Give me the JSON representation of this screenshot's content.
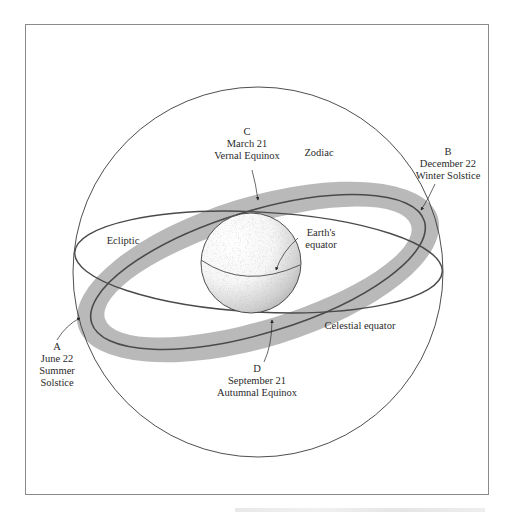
{
  "diagram": {
    "labels": {
      "zodiac": "Zodiac",
      "ecliptic": "Ecliptic",
      "celestial_equator": "Celestial equator",
      "earths_equator_line1": "Earth's",
      "earths_equator_line2": "equator"
    },
    "points": {
      "A": {
        "letter": "A",
        "date": "June 22",
        "event_line1": "Summer",
        "event_line2": "Solstice"
      },
      "B": {
        "letter": "B",
        "date": "December 22",
        "event": "Winter Solstice"
      },
      "C": {
        "letter": "C",
        "date": "March 21",
        "event": "Vernal Equinox"
      },
      "D": {
        "letter": "D",
        "date": "September 21",
        "event": "Autumnal Equinox"
      }
    },
    "colors": {
      "frame": "#8a8a8a",
      "zodiac_band": "#b9b9b9",
      "ecliptic_line": "#4a4a4a",
      "sphere_outline": "#3a3a3a",
      "text": "#2a2a2a"
    }
  }
}
